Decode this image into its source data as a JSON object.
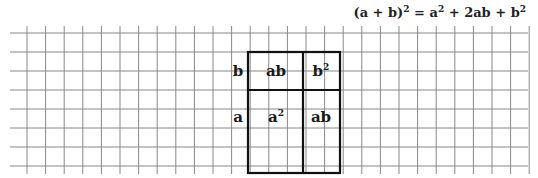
{
  "formula": {
    "lhs": "(a + b)",
    "lhs_exp": "2",
    "eq": " = ",
    "t1": "a",
    "t1_exp": "2",
    "plus1": " + 2ab + ",
    "t3": "b",
    "t3_exp": "2"
  },
  "diagram": {
    "side_labels": {
      "b": "b",
      "a": "a"
    },
    "cells": {
      "top_left": "ab",
      "top_right_base": "b",
      "top_right_exp": "2",
      "bottom_left_base": "a",
      "bottom_left_exp": "2",
      "bottom_right": "ab"
    }
  },
  "grid": {
    "cell_size": 18.7,
    "line_color": "#888888",
    "box_color": "#111111"
  }
}
